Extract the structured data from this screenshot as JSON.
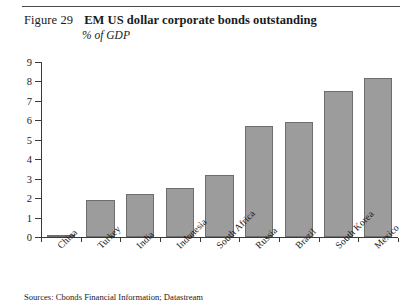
{
  "figure": {
    "number": "Figure 29",
    "title": "EM US dollar corporate bonds outstanding",
    "subtitle": "% of GDP"
  },
  "source": {
    "text": "Sources: Cbonds Financial Information; Datastream"
  },
  "colors": {
    "bar_fill": "#9c9c9c",
    "bar_edge": "#6e6e6e",
    "axis": "#3a3a3a",
    "rule": "#4a4a4a",
    "background": "#ffffff",
    "text": "#1a1a1a"
  },
  "chart_data": {
    "type": "bar",
    "title": "EM US dollar corporate bonds outstanding",
    "subtitle": "% of GDP",
    "xlabel": "",
    "ylabel": "% of GDP",
    "categories": [
      "China",
      "Turkey",
      "India",
      "Indonesia",
      "South Africa",
      "Russia",
      "Brazil",
      "South Korea",
      "Mexico"
    ],
    "values": [
      0.1,
      1.9,
      2.2,
      2.5,
      3.2,
      5.7,
      5.9,
      7.5,
      8.2
    ],
    "ylim": [
      0,
      9
    ],
    "yticks": [
      0,
      1,
      2,
      3,
      4,
      5,
      6,
      7,
      8,
      9
    ],
    "ytick_labels": [
      "0",
      "1",
      "2",
      "3",
      "4",
      "5",
      "6",
      "7",
      "8",
      "9"
    ],
    "grid": false,
    "legend": null,
    "xtick_label_rotation": -45,
    "source": "Sources: Cbonds Financial Information; Datastream"
  }
}
